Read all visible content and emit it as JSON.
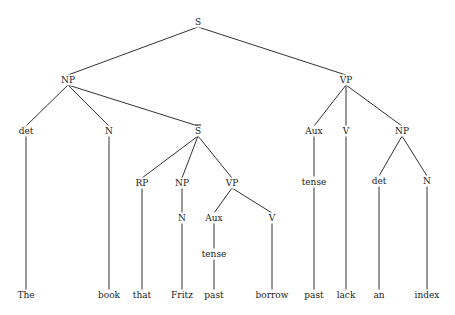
{
  "diagram": {
    "type": "syntax-tree",
    "nodes": [
      {
        "id": "S",
        "label": "S",
        "x": 198,
        "y": 22
      },
      {
        "id": "NP1",
        "label": "NP",
        "x": 68,
        "y": 80
      },
      {
        "id": "VP1",
        "label": "VP",
        "x": 346,
        "y": 80
      },
      {
        "id": "det1",
        "label": "det",
        "x": 26,
        "y": 131
      },
      {
        "id": "N1",
        "label": "N",
        "x": 109,
        "y": 131
      },
      {
        "id": "Sbar",
        "label": "S",
        "overline": true,
        "x": 198,
        "y": 131
      },
      {
        "id": "Aux1",
        "label": "Aux",
        "x": 314,
        "y": 131
      },
      {
        "id": "V1",
        "label": "V",
        "x": 346,
        "y": 131
      },
      {
        "id": "NP3",
        "label": "NP",
        "x": 402,
        "y": 131
      },
      {
        "id": "RP",
        "label": "RP",
        "x": 142,
        "y": 183
      },
      {
        "id": "NP2",
        "label": "NP",
        "x": 182,
        "y": 183
      },
      {
        "id": "VP2",
        "label": "VP",
        "x": 232,
        "y": 183
      },
      {
        "id": "tense1",
        "label": "tense",
        "x": 314,
        "y": 182
      },
      {
        "id": "det2",
        "label": "det",
        "x": 379,
        "y": 181
      },
      {
        "id": "N4",
        "label": "N",
        "x": 427,
        "y": 181
      },
      {
        "id": "N2",
        "label": "N",
        "x": 182,
        "y": 218
      },
      {
        "id": "Aux2",
        "label": "Aux",
        "x": 214,
        "y": 218
      },
      {
        "id": "V2",
        "label": "V",
        "x": 272,
        "y": 218
      },
      {
        "id": "tense2",
        "label": "tense",
        "x": 214,
        "y": 254
      },
      {
        "id": "w_The",
        "label": "The",
        "x": 26,
        "y": 295
      },
      {
        "id": "w_book",
        "label": "book",
        "x": 109,
        "y": 295
      },
      {
        "id": "w_that",
        "label": "that",
        "x": 142,
        "y": 295
      },
      {
        "id": "w_Fritz",
        "label": "Fritz",
        "x": 182,
        "y": 295
      },
      {
        "id": "w_past1",
        "label": "past",
        "x": 214,
        "y": 295
      },
      {
        "id": "w_borrow",
        "label": "borrow",
        "x": 272,
        "y": 295
      },
      {
        "id": "w_past2",
        "label": "past",
        "x": 314,
        "y": 295
      },
      {
        "id": "w_lack",
        "label": "lack",
        "x": 346,
        "y": 295
      },
      {
        "id": "w_an",
        "label": "an",
        "x": 379,
        "y": 295
      },
      {
        "id": "w_index",
        "label": "index",
        "x": 427,
        "y": 295
      }
    ],
    "edges": [
      [
        "S",
        "NP1"
      ],
      [
        "S",
        "VP1"
      ],
      [
        "NP1",
        "det1"
      ],
      [
        "NP1",
        "N1"
      ],
      [
        "NP1",
        "Sbar"
      ],
      [
        "VP1",
        "Aux1"
      ],
      [
        "VP1",
        "V1"
      ],
      [
        "VP1",
        "NP3"
      ],
      [
        "Sbar",
        "RP"
      ],
      [
        "Sbar",
        "NP2"
      ],
      [
        "Sbar",
        "VP2"
      ],
      [
        "Aux1",
        "tense1"
      ],
      [
        "NP3",
        "det2"
      ],
      [
        "NP3",
        "N4"
      ],
      [
        "NP2",
        "N2"
      ],
      [
        "VP2",
        "Aux2"
      ],
      [
        "VP2",
        "V2"
      ],
      [
        "Aux2",
        "tense2"
      ],
      [
        "det1",
        "w_The"
      ],
      [
        "N1",
        "w_book"
      ],
      [
        "RP",
        "w_that"
      ],
      [
        "N2",
        "w_Fritz"
      ],
      [
        "tense2",
        "w_past1"
      ],
      [
        "V2",
        "w_borrow"
      ],
      [
        "tense1",
        "w_past2"
      ],
      [
        "V1",
        "w_lack"
      ],
      [
        "det2",
        "w_an"
      ],
      [
        "N4",
        "w_index"
      ]
    ],
    "line_color": "#333333"
  }
}
